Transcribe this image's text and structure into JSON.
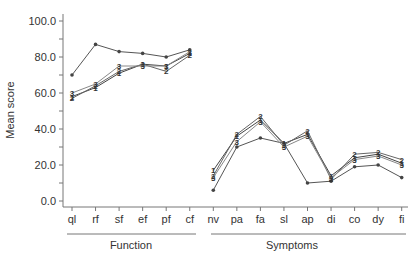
{
  "chart_data": {
    "type": "line",
    "title": "",
    "xlabel": "",
    "ylabel": "Mean score",
    "ylim": [
      0,
      100
    ],
    "yticks": [
      "0.0",
      "20.0",
      "40.0",
      "60.0",
      "80.0",
      "100.0"
    ],
    "grid": false,
    "legend": "none (series marked with inline labels 1, 2, 3 and an unlabeled dot marker)",
    "categories": [
      "ql",
      "rf",
      "sf",
      "ef",
      "pf",
      "cf",
      "nv",
      "pa",
      "fa",
      "sl",
      "ap",
      "di",
      "co",
      "dy",
      "fi"
    ],
    "groups": [
      {
        "name": "Function",
        "categories": [
          "ql",
          "rf",
          "sf",
          "ef",
          "pf",
          "cf"
        ]
      },
      {
        "name": "Symptoms",
        "categories": [
          "nv",
          "pa",
          "fa",
          "sl",
          "ap",
          "di",
          "co",
          "dy",
          "fi"
        ]
      }
    ],
    "series": [
      {
        "name": "dot",
        "marker": "•",
        "color": "#555555",
        "values": [
          70,
          87,
          83,
          82,
          80,
          84,
          6,
          30,
          35,
          32,
          10,
          11,
          19,
          20,
          13
        ]
      },
      {
        "name": "1",
        "marker": "1",
        "color": "#444444",
        "values": [
          58,
          63,
          71,
          76,
          75,
          82,
          17,
          36,
          45,
          32,
          37,
          14,
          24,
          26,
          21
        ]
      },
      {
        "name": "2",
        "marker": "2",
        "color": "#666666",
        "values": [
          57,
          64,
          72,
          76,
          72,
          81,
          14,
          37,
          47,
          31,
          39,
          12,
          26,
          27,
          23
        ]
      },
      {
        "name": "3",
        "marker": "3",
        "color": "#888888",
        "values": [
          60,
          65,
          75,
          75,
          75,
          83,
          13,
          33,
          44,
          30,
          36,
          13,
          23,
          25,
          20
        ]
      }
    ]
  }
}
